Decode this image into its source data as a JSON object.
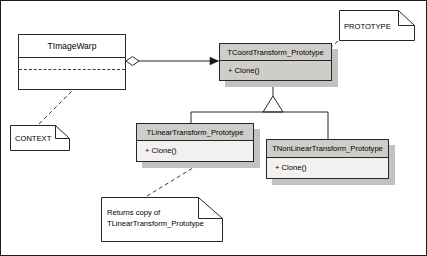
{
  "diagram": {
    "type": "uml-class-diagram",
    "canvas": {
      "width": 427,
      "height": 256,
      "background": "#ffffff"
    },
    "colors": {
      "line": "#262626",
      "class_header_fill": "#cfcdca",
      "class_body_fill": "#f2f1ef",
      "abstract_class_fill": "#cfcdca",
      "plain_class_fill": "#ffffff",
      "shadow": "#c4c2c0",
      "note_fill": "#ffffff",
      "dashed_line": "#3a3a3a"
    }
  },
  "classes": [
    {
      "id": "timagewarp",
      "name": "TImageWarp",
      "stereotype": "",
      "compartments": [],
      "fill": "#ffffff",
      "has_shadow": false
    },
    {
      "id": "tcoord",
      "name": "TCoordTransform_Prototype",
      "stereotype": "abstract",
      "compartments": [
        "+ Clone()"
      ],
      "fill": "#cfcdca",
      "has_shadow": true
    },
    {
      "id": "tlinear",
      "name": "TLinearTransform_Prototype",
      "stereotype": "",
      "compartments": [
        "+ Clone()"
      ],
      "fill": "#f2f1ef",
      "has_shadow": true
    },
    {
      "id": "tnonlinear",
      "name": "TNonLinearTransform_Prototype",
      "stereotype": "",
      "compartments": [
        "+ Clone()"
      ],
      "fill": "#f2f1ef",
      "has_shadow": true
    }
  ],
  "notes": [
    {
      "id": "prototype",
      "lines": [
        "PROTOTYPE"
      ],
      "anchor": "tcoord"
    },
    {
      "id": "context",
      "lines": [
        "CONTEXT"
      ],
      "anchor": "timagewarp"
    },
    {
      "id": "returns",
      "lines": [
        "Returns copy of",
        "TLinearTransform_Prototype"
      ],
      "line1": "Returns copy of",
      "line2": "TLinearTransform_Prototype",
      "anchor": "tlinear"
    }
  ],
  "relationships": [
    {
      "id": "aggregation",
      "kind": "aggregation",
      "from": "TImageWarp",
      "to": "TCoordTransform_Prototype",
      "source_decoration": "hollow-diamond",
      "target_decoration": "filled-arrow"
    },
    {
      "id": "gen-linear",
      "kind": "generalization",
      "from": "TLinearTransform_Prototype",
      "to": "TCoordTransform_Prototype",
      "target_decoration": "hollow-triangle"
    },
    {
      "id": "gen-nonlinear",
      "kind": "generalization",
      "from": "TNonLinearTransform_Prototype",
      "to": "TCoordTransform_Prototype",
      "target_decoration": "hollow-triangle"
    },
    {
      "id": "anchor-prototype",
      "kind": "note-anchor",
      "from": "PROTOTYPE",
      "to": "TCoordTransform_Prototype"
    },
    {
      "id": "anchor-context",
      "kind": "note-anchor",
      "from": "CONTEXT",
      "to": "TImageWarp"
    },
    {
      "id": "anchor-returns",
      "kind": "note-anchor",
      "from": "Returns copy of TLinearTransform_Prototype",
      "to": "TLinearTransform_Prototype"
    }
  ]
}
